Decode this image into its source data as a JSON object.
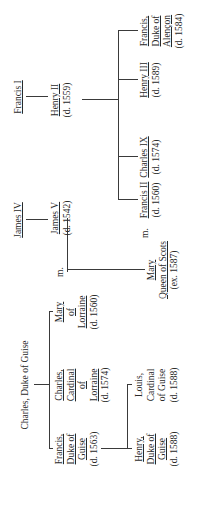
{
  "orientation": "rotated -90deg (text reads bottom-to-top)",
  "nodes": {
    "charles_guise": {
      "lines": [
        "Charles, Duke of Guise"
      ],
      "underlined": false
    },
    "francis_guise": {
      "lines": [
        "Francis,",
        "Duke of",
        "Guise",
        "(d. 1563)"
      ],
      "underlined_lines": 3
    },
    "charles_cardinal": {
      "lines": [
        "Charles,",
        "Cardinal",
        "of",
        "Lorraine",
        "(d. 1574)"
      ],
      "underlined_lines": 4
    },
    "mary_lorraine": {
      "lines": [
        "Mary",
        "of",
        "Lorraine",
        "(d. 1560)"
      ],
      "underlined_lines": 3
    },
    "henry_guise": {
      "lines": [
        "Henry,",
        "Duke of",
        "Guise",
        "(d. 1588)"
      ],
      "underlined_lines": 3
    },
    "louis_cardinal": {
      "lines": [
        "Louis,",
        "Cardinal",
        "of Guise",
        "(d. 1588)"
      ],
      "underlined_lines": 0
    },
    "james_iv": {
      "lines": [
        "James IV"
      ],
      "underlined_lines": 1
    },
    "james_v": {
      "lines": [
        "James V",
        "(d. 1542)"
      ],
      "underlined_lines": 1
    },
    "mary_scots": {
      "lines": [
        "Mary",
        "Queen of Scots",
        "(ex. 1587)"
      ],
      "underlined_lines": 2
    },
    "francis_i": {
      "lines": [
        "Francis I"
      ],
      "underlined_lines": 1
    },
    "henry_ii": {
      "lines": [
        "Henry II",
        "(d. 1559)"
      ],
      "underlined_lines": 1
    },
    "francis_ii": {
      "lines": [
        "Francis II",
        "(d. 1560)"
      ],
      "underlined_lines": 1
    },
    "charles_ix": {
      "lines": [
        "Charles IX",
        "(d. 1574)"
      ],
      "underlined_lines": 1
    },
    "henry_iii": {
      "lines": [
        "Henry III",
        "(d. 1589)"
      ],
      "underlined_lines": 1
    },
    "francis_alencon": {
      "lines": [
        "Francis,",
        "Duke of",
        "Alençon",
        "(d. 1584)"
      ],
      "underlined_lines": 3
    }
  },
  "marriage_labels": [
    "m.",
    "m."
  ],
  "relations": [
    {
      "parent": "Charles, Duke of Guise",
      "children": [
        "Francis, Duke of Guise",
        "Charles, Cardinal of Lorraine",
        "Mary of Lorraine"
      ]
    },
    {
      "parent": "Francis, Duke of Guise",
      "children": [
        "Henry, Duke of Guise",
        "Louis, Cardinal of Guise"
      ]
    },
    {
      "parent": "James IV",
      "children": [
        "James V"
      ]
    },
    {
      "marriage": [
        "Mary of Lorraine",
        "James V"
      ],
      "children": [
        "Mary Queen of Scots"
      ]
    },
    {
      "parent": "Francis I",
      "children": [
        "Henry II"
      ]
    },
    {
      "marriage": [
        "Mary Queen of Scots",
        "Francis II"
      ]
    },
    {
      "parent": "Henry II",
      "children": [
        "Francis II",
        "Charles IX",
        "Henry III",
        "Francis, Duke of Alençon"
      ]
    }
  ]
}
